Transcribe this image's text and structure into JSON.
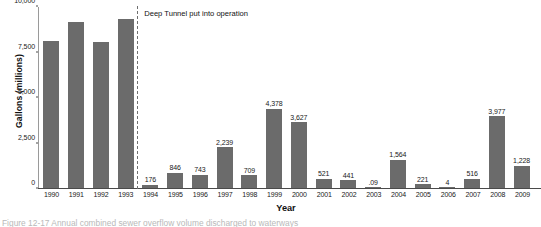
{
  "figure": {
    "caption_partial": "Figure 12-17   Annual combined sewer overflow volume discharged to waterways"
  },
  "annotation": {
    "text": "Deep Tunnel put into operation",
    "after_category": "1993",
    "line_style": "dashed"
  },
  "colors": {
    "bar": "#6b6b6b",
    "axis": "#4a4a4a",
    "divider": "#6f6f6f",
    "background": "#ffffff"
  },
  "chart_data": {
    "type": "bar",
    "title": "",
    "subtitle": "",
    "xlabel": "Year",
    "ylabel": "Gallons (millions)",
    "ylim": [
      0,
      10000
    ],
    "yticks": [
      0,
      2500,
      5000,
      7500,
      10000
    ],
    "ytick_labels": [
      "0",
      "2,500",
      "5,000",
      "7,500",
      "10,000"
    ],
    "grid": false,
    "legend": "none",
    "categories": [
      "1990",
      "1991",
      "1992",
      "1993",
      "1994",
      "1995",
      "1996",
      "1997",
      "1998",
      "1999",
      "2000",
      "2001",
      "2002",
      "2003",
      "2004",
      "2005",
      "2006",
      "2007",
      "2008",
      "2009"
    ],
    "values": [
      8100,
      9150,
      8080,
      9350,
      176,
      846,
      743,
      2239,
      709,
      4378,
      3627,
      521,
      441,
      0.09,
      1564,
      221,
      4,
      516,
      3977,
      1228
    ],
    "data_labels": [
      "",
      "",
      "",
      "",
      "176",
      "846",
      "743",
      "2,239",
      "709",
      "4,378",
      "3,627",
      "521",
      "441",
      ".09",
      "1,564",
      "221",
      "4",
      "516",
      "3,977",
      "1,228"
    ],
    "annotations": [
      {
        "text": "Deep Tunnel put into operation",
        "x": "between 1993 and 1994",
        "type": "vertical-dashed-line"
      }
    ]
  }
}
